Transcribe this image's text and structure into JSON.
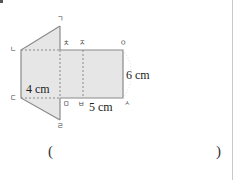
{
  "figure": {
    "type": "net of a triangular prism",
    "vertex_labels": {
      "g": "ㄱ",
      "n": "ㄴ",
      "d": "ㄷ",
      "r": "ㄹ",
      "m": "ㅁ",
      "b": "ㅂ",
      "s": "ㅅ",
      "o": "ㅇ",
      "j": "ㅈ",
      "ch": "ㅊ"
    },
    "dimensions": {
      "height_left": "4 cm",
      "height_right": "6 cm",
      "bottom": "5 cm"
    },
    "colors": {
      "fill": "#e6e6e6",
      "stroke": "#8a8a8a",
      "dash": "#8a8a8a"
    }
  },
  "answer": {
    "open_paren": "(",
    "close_paren": ")"
  }
}
